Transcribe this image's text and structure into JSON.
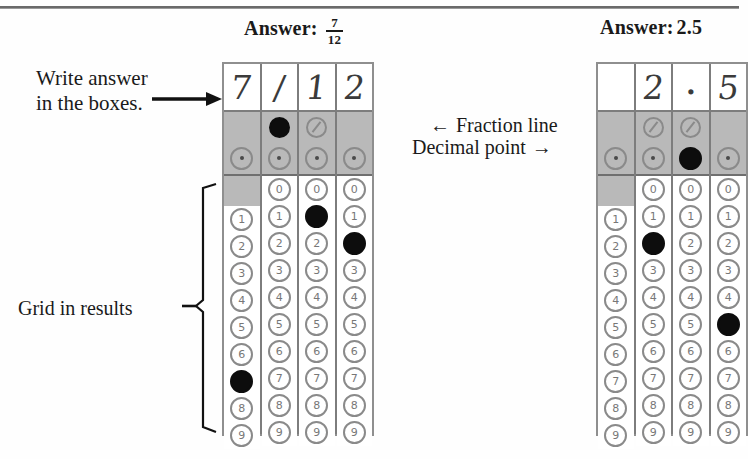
{
  "annotations": {
    "write_answer": "Write answer\nin the boxes.",
    "write_answer_line1": "Write answer",
    "write_answer_line2": "in the boxes.",
    "fraction_line": "Fraction line",
    "decimal_point": "Decimal point",
    "grid_in_results": "Grid in results",
    "arrow_left_glyph": "←",
    "arrow_right_glyph": "→"
  },
  "icons": {
    "arrow_right": "arrow-right-icon",
    "arrow_left": "arrow-left-icon",
    "brace": "curly-brace-icon",
    "slash_bubble": "fraction-slash-bubble-icon",
    "dot_bubble": "decimal-point-bubble-icon"
  },
  "colors": {
    "shade": "#b9b9b9",
    "bubble_outline": "#8a8a8a",
    "bubble_filled": "#0d0d0d",
    "grid_border": "#8f8f8f",
    "paper": "#ffffff"
  },
  "grids": [
    {
      "id": "grid-fraction",
      "heading_label": "Answer:",
      "heading_value_numerator": "7",
      "heading_value_denominator": "12",
      "heading_value_plain": "7/12",
      "written_answer": [
        "7",
        "/",
        "1",
        "2"
      ],
      "columns": [
        {
          "written": "7",
          "has_slash_bubble": false,
          "slash_filled": false,
          "has_dot_bubble": true,
          "dot_filled": false,
          "has_zero_bubble": false,
          "digits": [
            "1",
            "2",
            "3",
            "4",
            "5",
            "6",
            "7",
            "8",
            "9"
          ],
          "filled_digit": "7"
        },
        {
          "written": "/",
          "has_slash_bubble": true,
          "slash_filled": true,
          "has_dot_bubble": true,
          "dot_filled": false,
          "has_zero_bubble": true,
          "digits": [
            "0",
            "1",
            "2",
            "3",
            "4",
            "5",
            "6",
            "7",
            "8",
            "9"
          ],
          "filled_digit": null
        },
        {
          "written": "1",
          "has_slash_bubble": true,
          "slash_filled": false,
          "has_dot_bubble": true,
          "dot_filled": false,
          "has_zero_bubble": true,
          "digits": [
            "0",
            "1",
            "2",
            "3",
            "4",
            "5",
            "6",
            "7",
            "8",
            "9"
          ],
          "filled_digit": "1"
        },
        {
          "written": "2",
          "has_slash_bubble": false,
          "slash_filled": false,
          "has_dot_bubble": true,
          "dot_filled": false,
          "has_zero_bubble": true,
          "digits": [
            "0",
            "1",
            "2",
            "3",
            "4",
            "5",
            "6",
            "7",
            "8",
            "9"
          ],
          "filled_digit": "2"
        }
      ]
    },
    {
      "id": "grid-decimal",
      "heading_label": "Answer:",
      "heading_value_plain": "2.5",
      "written_answer": [
        "",
        "2",
        ".",
        "5"
      ],
      "columns": [
        {
          "written": "",
          "has_slash_bubble": false,
          "slash_filled": false,
          "has_dot_bubble": true,
          "dot_filled": false,
          "has_zero_bubble": false,
          "digits": [
            "1",
            "2",
            "3",
            "4",
            "5",
            "6",
            "7",
            "8",
            "9"
          ],
          "filled_digit": null
        },
        {
          "written": "2",
          "has_slash_bubble": true,
          "slash_filled": false,
          "has_dot_bubble": true,
          "dot_filled": false,
          "has_zero_bubble": true,
          "digits": [
            "0",
            "1",
            "2",
            "3",
            "4",
            "5",
            "6",
            "7",
            "8",
            "9"
          ],
          "filled_digit": "2"
        },
        {
          "written": ".",
          "has_slash_bubble": true,
          "slash_filled": false,
          "has_dot_bubble": true,
          "dot_filled": true,
          "has_zero_bubble": true,
          "digits": [
            "0",
            "1",
            "2",
            "3",
            "4",
            "5",
            "6",
            "7",
            "8",
            "9"
          ],
          "filled_digit": null
        },
        {
          "written": "5",
          "has_slash_bubble": false,
          "slash_filled": false,
          "has_dot_bubble": true,
          "dot_filled": false,
          "has_zero_bubble": true,
          "digits": [
            "0",
            "1",
            "2",
            "3",
            "4",
            "5",
            "6",
            "7",
            "8",
            "9"
          ],
          "filled_digit": "5"
        }
      ]
    }
  ]
}
